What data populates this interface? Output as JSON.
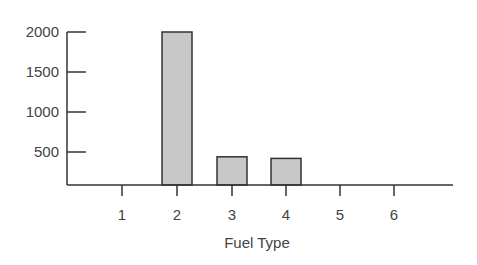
{
  "chart_data": {
    "type": "bar",
    "title": "",
    "xlabel": "Fuel Type",
    "ylabel": "",
    "categories": [
      "1",
      "2",
      "3",
      "4",
      "5",
      "6"
    ],
    "values": [
      0,
      2000,
      440,
      420,
      0,
      0
    ],
    "yticks": [
      500,
      1000,
      1500,
      2000
    ],
    "ylim": [
      0,
      2000
    ],
    "grid": false,
    "legend": null,
    "bar_color": "#c8c8c8",
    "edge_color": "#333333"
  }
}
